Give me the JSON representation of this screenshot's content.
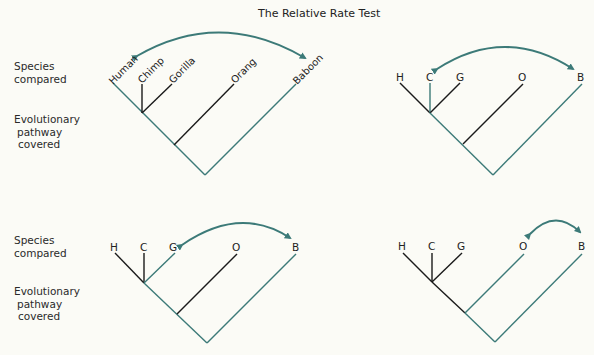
{
  "title": "The Relative Rate Test",
  "colors": {
    "highlight": "#3c7a78",
    "branch": "#1a1a1a",
    "background": "#fbfbf6"
  },
  "row_labels": [
    {
      "species": [
        "Species",
        "compared"
      ],
      "pathway": [
        "Evolutionary",
        "pathway",
        "covered"
      ]
    },
    {
      "species": [
        "Species",
        "compared"
      ],
      "pathway": [
        "Evolutionary",
        "pathway",
        "covered"
      ]
    }
  ],
  "panels": [
    {
      "id": "panel-1",
      "labels": [
        "Human",
        "Chimp",
        "Gorilla",
        "Orang",
        "Baboon"
      ],
      "compared": [
        "Human",
        "Baboon"
      ]
    },
    {
      "id": "panel-2",
      "labels": [
        "H",
        "C",
        "G",
        "O",
        "B"
      ],
      "compared": [
        "C",
        "B"
      ]
    },
    {
      "id": "panel-3",
      "labels": [
        "H",
        "C",
        "G",
        "O",
        "B"
      ],
      "compared": [
        "G",
        "B"
      ]
    },
    {
      "id": "panel-4",
      "labels": [
        "H",
        "C",
        "G",
        "O",
        "B"
      ],
      "compared": [
        "O",
        "B"
      ]
    }
  ]
}
